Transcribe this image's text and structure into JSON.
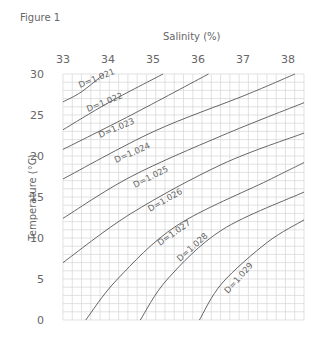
{
  "figure": {
    "title": "Figure 1"
  },
  "chart_data": {
    "type": "line",
    "title": "Figure 1",
    "xlabel": "Salinity (%)",
    "ylabel": "Temperature (°C)",
    "xlim": [
      33,
      38.3
    ],
    "ylim": [
      0,
      30
    ],
    "x_ticks": [
      "33",
      "34",
      "35",
      "36",
      "37",
      "38"
    ],
    "y_ticks": [
      "0",
      "5",
      "10",
      "15",
      "20",
      "25",
      "30"
    ],
    "grid": true,
    "legend": "inline curve labels",
    "series": [
      {
        "name": "D=1.021",
        "points": [
          [
            33.0,
            26.6
          ],
          [
            33.4,
            27.8
          ],
          [
            33.9,
            30.0
          ]
        ]
      },
      {
        "name": "D=1.022",
        "points": [
          [
            33.0,
            23.2
          ],
          [
            34.0,
            26.5
          ],
          [
            35.2,
            30.0
          ]
        ]
      },
      {
        "name": "D=1.023",
        "points": [
          [
            33.0,
            20.8
          ],
          [
            34.5,
            25.0
          ],
          [
            36.2,
            30.0
          ]
        ]
      },
      {
        "name": "D=1.024",
        "points": [
          [
            33.0,
            17.2
          ],
          [
            35.0,
            23.0
          ],
          [
            37.0,
            27.4
          ],
          [
            38.1,
            30.0
          ]
        ]
      },
      {
        "name": "D=1.025",
        "points": [
          [
            33.0,
            12.4
          ],
          [
            34.5,
            17.5
          ],
          [
            36.5,
            22.5
          ],
          [
            38.3,
            26.5
          ]
        ]
      },
      {
        "name": "D=1.026",
        "points": [
          [
            33.0,
            7.0
          ],
          [
            34.5,
            13.0
          ],
          [
            36.5,
            19.0
          ],
          [
            38.3,
            22.8
          ]
        ]
      },
      {
        "name": "D=1.027",
        "points": [
          [
            33.5,
            0.0
          ],
          [
            34.2,
            5.0
          ],
          [
            35.5,
            11.5
          ],
          [
            37.5,
            17.0
          ],
          [
            38.3,
            19.2
          ]
        ]
      },
      {
        "name": "D=1.028",
        "points": [
          [
            34.7,
            0.0
          ],
          [
            35.3,
            5.0
          ],
          [
            36.5,
            11.0
          ],
          [
            38.3,
            15.6
          ]
        ]
      },
      {
        "name": "D=1.029",
        "points": [
          [
            36.0,
            0.0
          ],
          [
            36.5,
            4.5
          ],
          [
            37.5,
            9.5
          ],
          [
            38.3,
            12.2
          ]
        ]
      }
    ]
  }
}
